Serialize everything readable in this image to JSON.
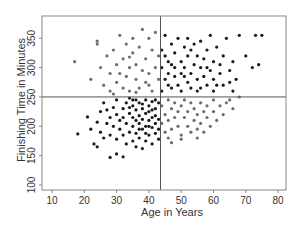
{
  "chart_data": {
    "type": "scatter",
    "title": "",
    "xlabel": "Age in Years",
    "ylabel": "Finishing Time in Minutes",
    "xlim": [
      7,
      83
    ],
    "ylim": [
      91,
      390
    ],
    "xticks": [
      10,
      20,
      30,
      40,
      50,
      60,
      70,
      80
    ],
    "yticks": [
      100,
      150,
      200,
      250,
      300,
      350
    ],
    "grid": false,
    "legend": null,
    "reference_lines": {
      "vertical_x": 43.6,
      "horizontal_y": 250
    },
    "colors": {
      "dark": "#1a1a1a",
      "gray": "#6e6e6e",
      "axis": "#777777",
      "ref_line": "#555555"
    },
    "series": [
      {
        "name": "concordant",
        "color": "#1a1a1a",
        "points": [
          [
            18,
            187
          ],
          [
            21,
            216
          ],
          [
            22,
            195
          ],
          [
            23,
            170
          ],
          [
            24,
            165
          ],
          [
            24,
            207
          ],
          [
            25,
            225
          ],
          [
            25,
            190
          ],
          [
            26,
            180
          ],
          [
            26,
            240
          ],
          [
            27,
            228
          ],
          [
            27,
            205
          ],
          [
            28,
            147
          ],
          [
            28,
            185
          ],
          [
            28,
            215
          ],
          [
            29,
            200
          ],
          [
            29,
            232
          ],
          [
            30,
            153
          ],
          [
            30,
            178
          ],
          [
            30,
            220
          ],
          [
            30,
            245
          ],
          [
            31,
            195
          ],
          [
            31,
            210
          ],
          [
            32,
            148
          ],
          [
            32,
            230
          ],
          [
            32,
            185
          ],
          [
            33,
            170
          ],
          [
            33,
            240
          ],
          [
            33,
            205
          ],
          [
            34,
            190
          ],
          [
            34,
            222
          ],
          [
            34,
            248
          ],
          [
            35,
            175
          ],
          [
            35,
            200
          ],
          [
            35,
            215
          ],
          [
            35,
            235
          ],
          [
            36,
            165
          ],
          [
            36,
            188
          ],
          [
            36,
            228
          ],
          [
            36,
            245
          ],
          [
            37,
            180
          ],
          [
            37,
            205
          ],
          [
            37,
            218
          ],
          [
            37,
            240
          ],
          [
            38,
            162
          ],
          [
            38,
            195
          ],
          [
            38,
            230
          ],
          [
            38,
            212
          ],
          [
            39,
            175
          ],
          [
            39,
            200
          ],
          [
            39,
            222
          ],
          [
            39,
            245
          ],
          [
            40,
            185
          ],
          [
            40,
            210
          ],
          [
            40,
            235
          ],
          [
            40,
            225
          ],
          [
            41,
            170
          ],
          [
            41,
            198
          ],
          [
            41,
            215
          ],
          [
            41,
            242
          ],
          [
            42,
            188
          ],
          [
            42,
            205
          ],
          [
            42,
            230
          ],
          [
            42,
            218
          ],
          [
            43,
            195
          ],
          [
            43,
            240
          ],
          [
            43,
            212
          ],
          [
            43,
            178
          ],
          [
            36,
            210
          ],
          [
            34,
            232
          ],
          [
            32,
            215
          ],
          [
            39,
            188
          ],
          [
            41,
            228
          ],
          [
            37,
            195
          ],
          [
            40,
            200
          ],
          [
            42,
            245
          ],
          [
            38,
            238
          ],
          [
            35,
            245
          ],
          [
            44,
            260
          ],
          [
            44,
            300
          ],
          [
            44,
            330
          ],
          [
            45,
            280
          ],
          [
            45,
            320
          ],
          [
            45,
            355
          ],
          [
            46,
            270
          ],
          [
            46,
            310
          ],
          [
            46,
            290
          ],
          [
            47,
            340
          ],
          [
            47,
            265
          ],
          [
            48,
            300
          ],
          [
            48,
            285
          ],
          [
            48,
            325
          ],
          [
            49,
            350
          ],
          [
            49,
            270
          ],
          [
            50,
            310
          ],
          [
            50,
            290
          ],
          [
            50,
            260
          ],
          [
            51,
            335
          ],
          [
            51,
            300
          ],
          [
            52,
            275
          ],
          [
            52,
            320
          ],
          [
            52,
            350
          ],
          [
            53,
            290
          ],
          [
            53,
            265
          ],
          [
            54,
            305
          ],
          [
            54,
            340
          ],
          [
            55,
            280
          ],
          [
            55,
            320
          ],
          [
            55,
            260
          ],
          [
            56,
            300
          ],
          [
            56,
            345
          ],
          [
            57,
            285
          ],
          [
            57,
            315
          ],
          [
            58,
            270
          ],
          [
            58,
            330
          ],
          [
            59,
            295
          ],
          [
            59,
            355
          ],
          [
            60,
            280
          ],
          [
            60,
            310
          ],
          [
            60,
            260
          ],
          [
            61,
            335
          ],
          [
            62,
            290
          ],
          [
            62,
            305
          ],
          [
            63,
            270
          ],
          [
            63,
            320
          ],
          [
            64,
            350
          ],
          [
            65,
            295
          ],
          [
            65,
            275
          ],
          [
            66,
            260
          ],
          [
            66,
            310
          ],
          [
            67,
            280
          ],
          [
            68,
            355
          ],
          [
            70,
            320
          ],
          [
            72,
            300
          ],
          [
            73,
            355
          ],
          [
            75,
            355
          ],
          [
            74,
            305
          ],
          [
            47,
            305
          ],
          [
            53,
            330
          ],
          [
            58,
            300
          ],
          [
            61,
            270
          ],
          [
            51,
            285
          ],
          [
            56,
            265
          ]
        ]
      },
      {
        "name": "discordant",
        "color": "#6e6e6e",
        "points": [
          [
            17,
            310
          ],
          [
            22,
            280
          ],
          [
            24,
            345
          ],
          [
            24,
            340
          ],
          [
            25,
            300
          ],
          [
            26,
            270
          ],
          [
            27,
            320
          ],
          [
            28,
            290
          ],
          [
            28,
            260
          ],
          [
            29,
            330
          ],
          [
            30,
            305
          ],
          [
            30,
            275
          ],
          [
            31,
            355
          ],
          [
            31,
            290
          ],
          [
            32,
            265
          ],
          [
            32,
            315
          ],
          [
            33,
            340
          ],
          [
            33,
            285
          ],
          [
            34,
            300
          ],
          [
            34,
            260
          ],
          [
            35,
            325
          ],
          [
            35,
            350
          ],
          [
            36,
            280
          ],
          [
            36,
            305
          ],
          [
            37,
            265
          ],
          [
            37,
            335
          ],
          [
            38,
            295
          ],
          [
            38,
            365
          ],
          [
            39,
            275
          ],
          [
            39,
            315
          ],
          [
            40,
            350
          ],
          [
            40,
            290
          ],
          [
            41,
            260
          ],
          [
            41,
            330
          ],
          [
            42,
            300
          ],
          [
            42,
            360
          ],
          [
            43,
            280
          ],
          [
            43,
            320
          ],
          [
            29,
            255
          ],
          [
            36,
            258
          ],
          [
            40,
            270
          ],
          [
            34,
            318
          ],
          [
            44,
            235
          ],
          [
            44,
            205
          ],
          [
            45,
            220
          ],
          [
            45,
            190
          ],
          [
            46,
            245
          ],
          [
            46,
            210
          ],
          [
            47,
            230
          ],
          [
            47,
            195
          ],
          [
            48,
            215
          ],
          [
            48,
            240
          ],
          [
            49,
            200
          ],
          [
            49,
            225
          ],
          [
            50,
            185
          ],
          [
            50,
            235
          ],
          [
            51,
            215
          ],
          [
            51,
            245
          ],
          [
            52,
            200
          ],
          [
            52,
            225
          ],
          [
            53,
            190
          ],
          [
            53,
            240
          ],
          [
            54,
            210
          ],
          [
            54,
            230
          ],
          [
            55,
            195
          ],
          [
            55,
            220
          ],
          [
            56,
            205
          ],
          [
            56,
            240
          ],
          [
            57,
            225
          ],
          [
            57,
            190
          ],
          [
            58,
            215
          ],
          [
            58,
            235
          ],
          [
            59,
            200
          ],
          [
            60,
            225
          ],
          [
            60,
            245
          ],
          [
            61,
            210
          ],
          [
            62,
            235
          ],
          [
            63,
            220
          ],
          [
            64,
            240
          ],
          [
            65,
            245
          ],
          [
            66,
            230
          ],
          [
            68,
            250
          ],
          [
            46,
            180
          ],
          [
            47,
            172
          ],
          [
            55,
            180
          ],
          [
            50,
            178
          ]
        ]
      }
    ]
  }
}
